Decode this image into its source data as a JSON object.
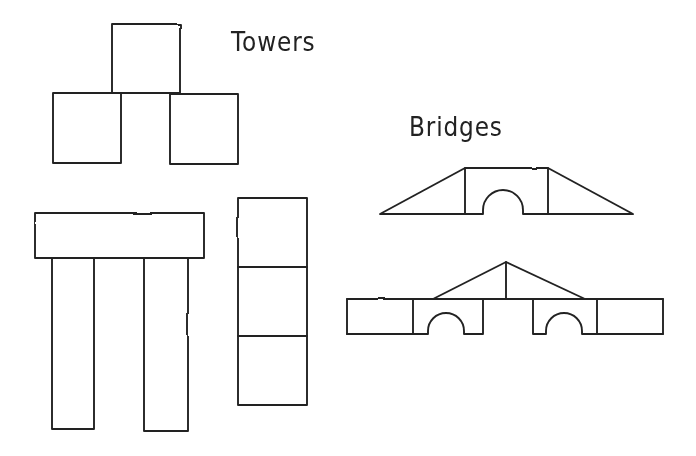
{
  "colors": {
    "ink": "#222222",
    "paper": "#ffffff"
  },
  "labels": {
    "towers": "Towers",
    "bridges": "Bridges"
  },
  "figures": {
    "tower_pyramid": {
      "name": "three-block pyramid tower",
      "top_block": "M112,24 H180 V93 H112 Z",
      "left_block": "M53,93 H121 V163 H53 Z",
      "right_block": "M170,94 H238 V164 H170 Z"
    },
    "tower_table": {
      "name": "beam on two tall pillars",
      "beam": "M35,213 H204 V258 H35 Z",
      "left_pillar": "M52,258 H94 V429 H52 Z",
      "right_pillar": "M144,258 H188 V431 H144 Z"
    },
    "tower_stack": {
      "name": "stack of three square blocks",
      "outline": "M238,198 H307 V405 H238 Z",
      "divider_upper": "M238,267 H307",
      "divider_lower": "M238,336 H307"
    },
    "bridge_arch": {
      "name": "arch bridge with two ramps",
      "outline": "M380,214 L465,168 H548 L633,214 H523 V210 A20,20 0 0 0 483,210 V214 H380 Z",
      "left_joint": "M465,168 V214",
      "right_joint": "M548,168 V214"
    },
    "bridge_double": {
      "name": "double-arch bridge with gable roof",
      "deck_top": "M347,299 H663",
      "left_end": "M347,299 V334",
      "right_end": "M663,299 V334",
      "bottom_left": "M347,334 H428 V331 A18,18 0 0 1 464,331 V334 H483 V299",
      "bottom_right": "M533,299 V334 H546 V331 A18,18 0 0 1 582,331 V334 H663",
      "joint_left": "M413,299 V334",
      "joint_right": "M597,299 V334",
      "gable": "M433,299 L506,262 L585,299",
      "gable_post": "M506,262 V299"
    }
  }
}
